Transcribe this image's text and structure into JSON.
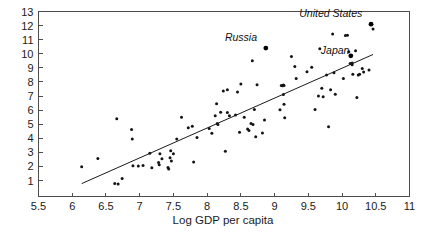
{
  "chart_data": {
    "type": "scatter",
    "title": "",
    "xlabel": "Log GDP per capita",
    "ylabel": "",
    "xlim": [
      5.5,
      11
    ],
    "ylim": [
      0.4,
      13
    ],
    "grid": false,
    "legend": null,
    "xticks": [
      5.5,
      6,
      6.5,
      7,
      7.5,
      8,
      8.5,
      9,
      9.5,
      10,
      10.5,
      11
    ],
    "xticklabels": [
      "5.5",
      "6",
      "6.5",
      "7",
      "7.5",
      "8",
      "8.5",
      "9",
      "9.5",
      "10",
      "10.5",
      "11"
    ],
    "yticks": [
      1,
      2,
      3,
      4,
      5,
      6,
      7,
      8,
      9,
      10,
      11,
      12,
      13
    ],
    "yticklabels": [
      "1",
      "2",
      "3",
      "4",
      "5",
      "6",
      "7",
      "8",
      "9",
      "10",
      "11",
      "12",
      "13"
    ],
    "trendline": {
      "x": [
        6.14,
        10.46
      ],
      "y": [
        0.78,
        9.95
      ]
    },
    "annotations": [
      {
        "label": "United States",
        "x": 10.43,
        "y": 12.1,
        "label_anchor_x": 10.3,
        "label_anchor_y": 12.62
      },
      {
        "label": "Russia",
        "x": 8.87,
        "y": 10.4,
        "label_anchor_x": 8.74,
        "label_anchor_y": 10.92
      },
      {
        "label": "Japan",
        "x": 10.13,
        "y": 9.85,
        "label_anchor_x": 10.11,
        "label_anchor_y": 10.0
      }
    ],
    "points": [
      {
        "x": 6.14,
        "y": 1.97
      },
      {
        "x": 6.38,
        "y": 2.56
      },
      {
        "x": 6.63,
        "y": 0.78
      },
      {
        "x": 6.68,
        "y": 0.76
      },
      {
        "x": 6.66,
        "y": 5.38
      },
      {
        "x": 6.74,
        "y": 1.15
      },
      {
        "x": 6.88,
        "y": 4.62
      },
      {
        "x": 6.89,
        "y": 3.95
      },
      {
        "x": 6.9,
        "y": 2.05
      },
      {
        "x": 6.98,
        "y": 2.03
      },
      {
        "x": 7.05,
        "y": 2.07
      },
      {
        "x": 7.15,
        "y": 2.93
      },
      {
        "x": 7.18,
        "y": 1.9
      },
      {
        "x": 7.28,
        "y": 2.28
      },
      {
        "x": 7.29,
        "y": 2.12
      },
      {
        "x": 7.3,
        "y": 2.9
      },
      {
        "x": 7.33,
        "y": 2.55
      },
      {
        "x": 7.42,
        "y": 1.92
      },
      {
        "x": 7.43,
        "y": 1.82
      },
      {
        "x": 7.45,
        "y": 2.62
      },
      {
        "x": 7.46,
        "y": 3.12
      },
      {
        "x": 7.47,
        "y": 2.38
      },
      {
        "x": 7.5,
        "y": 2.9
      },
      {
        "x": 7.55,
        "y": 3.95
      },
      {
        "x": 7.62,
        "y": 5.5
      },
      {
        "x": 7.72,
        "y": 4.75
      },
      {
        "x": 7.78,
        "y": 4.85
      },
      {
        "x": 7.8,
        "y": 2.32
      },
      {
        "x": 7.85,
        "y": 4.05
      },
      {
        "x": 8.03,
        "y": 4.7
      },
      {
        "x": 8.07,
        "y": 4.35
      },
      {
        "x": 8.12,
        "y": 5.6
      },
      {
        "x": 8.14,
        "y": 6.45
      },
      {
        "x": 8.15,
        "y": 5.05
      },
      {
        "x": 8.16,
        "y": 4.98
      },
      {
        "x": 8.2,
        "y": 5.85
      },
      {
        "x": 8.24,
        "y": 7.35
      },
      {
        "x": 8.27,
        "y": 3.07
      },
      {
        "x": 8.3,
        "y": 7.45
      },
      {
        "x": 8.3,
        "y": 5.82
      },
      {
        "x": 8.33,
        "y": 5.6
      },
      {
        "x": 8.42,
        "y": 5.65
      },
      {
        "x": 8.45,
        "y": 7.28
      },
      {
        "x": 8.48,
        "y": 4.42
      },
      {
        "x": 8.5,
        "y": 7.85
      },
      {
        "x": 8.55,
        "y": 5.5
      },
      {
        "x": 8.6,
        "y": 4.65
      },
      {
        "x": 8.62,
        "y": 4.55
      },
      {
        "x": 8.65,
        "y": 5.05
      },
      {
        "x": 8.67,
        "y": 9.5
      },
      {
        "x": 8.68,
        "y": 4.98
      },
      {
        "x": 8.7,
        "y": 6.05
      },
      {
        "x": 8.72,
        "y": 4.1
      },
      {
        "x": 8.74,
        "y": 7.8
      },
      {
        "x": 8.82,
        "y": 4.38
      },
      {
        "x": 8.85,
        "y": 5.3
      },
      {
        "x": 8.87,
        "y": 10.4
      },
      {
        "x": 9.08,
        "y": 6.02
      },
      {
        "x": 9.1,
        "y": 7.75
      },
      {
        "x": 9.12,
        "y": 7.72
      },
      {
        "x": 9.13,
        "y": 7.78
      },
      {
        "x": 9.14,
        "y": 7.75
      },
      {
        "x": 9.13,
        "y": 7.1
      },
      {
        "x": 9.14,
        "y": 6.42
      },
      {
        "x": 9.15,
        "y": 5.45
      },
      {
        "x": 9.25,
        "y": 9.8
      },
      {
        "x": 9.3,
        "y": 9.1
      },
      {
        "x": 9.32,
        "y": 8.25
      },
      {
        "x": 9.48,
        "y": 8.72
      },
      {
        "x": 9.55,
        "y": 9.05
      },
      {
        "x": 9.6,
        "y": 6.05
      },
      {
        "x": 9.65,
        "y": 7.0
      },
      {
        "x": 9.67,
        "y": 10.35
      },
      {
        "x": 9.7,
        "y": 7.55
      },
      {
        "x": 9.72,
        "y": 6.95
      },
      {
        "x": 9.77,
        "y": 8.5
      },
      {
        "x": 9.8,
        "y": 4.82
      },
      {
        "x": 9.83,
        "y": 7.45
      },
      {
        "x": 9.86,
        "y": 11.4
      },
      {
        "x": 9.88,
        "y": 8.65
      },
      {
        "x": 9.9,
        "y": 7.12
      },
      {
        "x": 10.02,
        "y": 8.25
      },
      {
        "x": 10.05,
        "y": 11.3
      },
      {
        "x": 10.08,
        "y": 11.32
      },
      {
        "x": 10.1,
        "y": 10.15
      },
      {
        "x": 10.12,
        "y": 9.3
      },
      {
        "x": 10.13,
        "y": 9.85
      },
      {
        "x": 10.15,
        "y": 9.35
      },
      {
        "x": 10.15,
        "y": 9.22
      },
      {
        "x": 10.16,
        "y": 8.55
      },
      {
        "x": 10.2,
        "y": 10.22
      },
      {
        "x": 10.22,
        "y": 6.9
      },
      {
        "x": 10.24,
        "y": 8.5
      },
      {
        "x": 10.26,
        "y": 8.55
      },
      {
        "x": 10.3,
        "y": 8.95
      },
      {
        "x": 10.32,
        "y": 8.7
      },
      {
        "x": 10.4,
        "y": 8.85
      },
      {
        "x": 10.43,
        "y": 12.1
      },
      {
        "x": 10.46,
        "y": 11.75
      }
    ]
  },
  "colors": {
    "background": "#ffffff",
    "axis": "#4d4d4d",
    "point": "#141414",
    "trendline": "#1a1a1a",
    "text": "#1a1a1a"
  }
}
